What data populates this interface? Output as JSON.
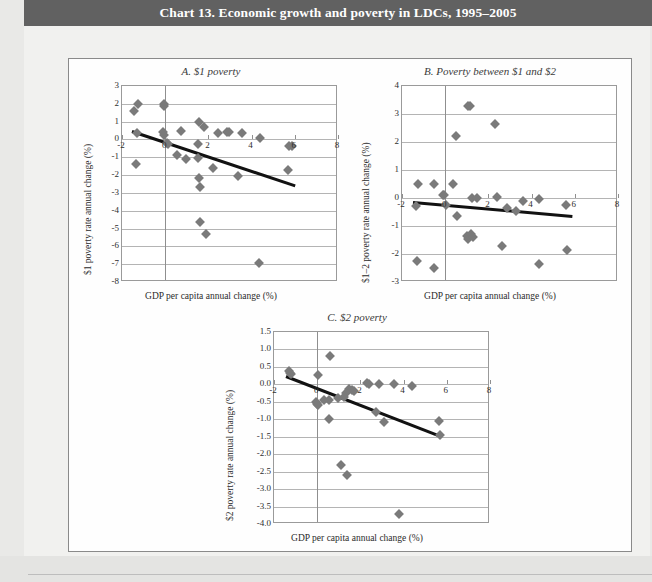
{
  "header": {
    "title": "Chart 13. Economic growth and poverty in LDCs, 1995–2005"
  },
  "colors": {
    "title_bar": "#616161",
    "marker": "#7a7a7a",
    "trendline": "#121212",
    "gridline": "#b4b4b4",
    "plot_background": "#ffffff",
    "page_background": "#e9e9e7"
  },
  "chart_data": [
    {
      "id": "panel-a",
      "type": "scatter",
      "title": "A.  $1 poverty",
      "xlabel": "GDP per capita annual change (%)",
      "ylabel": "$1 poverty rate annual change (%)",
      "xlim": [
        -2,
        8
      ],
      "ylim": [
        -8,
        3
      ],
      "xticks": [
        -2,
        0,
        2,
        4,
        6,
        8
      ],
      "yticks": [
        3,
        2,
        1,
        0,
        -1,
        -2,
        -3,
        -4,
        -5,
        -6,
        -7,
        -8
      ],
      "ytick_labels": [
        "3",
        "2",
        "1",
        "0",
        "-1",
        "-2",
        "-3",
        "-4",
        "-5",
        "-6",
        "-7",
        "-8"
      ],
      "xtick_labels": [
        "-2",
        "0",
        "2",
        "4",
        "6",
        "8"
      ],
      "grid": true,
      "legend": "none",
      "points": [
        {
          "x": -1.25,
          "y": 2.0
        },
        {
          "x": -1.45,
          "y": 1.6
        },
        {
          "x": -0.05,
          "y": 2.0
        },
        {
          "x": -0.05,
          "y": 1.85
        },
        {
          "x": -1.3,
          "y": 0.35
        },
        {
          "x": -0.1,
          "y": 0.4
        },
        {
          "x": -0.05,
          "y": 0.25
        },
        {
          "x": 0.75,
          "y": 0.45
        },
        {
          "x": 1.55,
          "y": 1.0
        },
        {
          "x": 1.8,
          "y": 0.7
        },
        {
          "x": 2.45,
          "y": 0.35
        },
        {
          "x": 2.85,
          "y": 0.4
        },
        {
          "x": 2.95,
          "y": 0.4
        },
        {
          "x": 3.55,
          "y": 0.35
        },
        {
          "x": 4.4,
          "y": 0.1
        },
        {
          "x": 5.75,
          "y": -0.35
        },
        {
          "x": 5.85,
          "y": -0.35
        },
        {
          "x": 0.1,
          "y": -0.2
        },
        {
          "x": 0.15,
          "y": -0.25
        },
        {
          "x": 1.5,
          "y": -0.25
        },
        {
          "x": 0.55,
          "y": -0.9
        },
        {
          "x": 0.95,
          "y": -1.1
        },
        {
          "x": 1.5,
          "y": -1.05
        },
        {
          "x": -1.35,
          "y": -1.4
        },
        {
          "x": 2.2,
          "y": -1.6
        },
        {
          "x": 5.7,
          "y": -1.7
        },
        {
          "x": 1.55,
          "y": -2.15
        },
        {
          "x": 3.35,
          "y": -2.05
        },
        {
          "x": 1.6,
          "y": -2.65
        },
        {
          "x": 1.6,
          "y": -4.65
        },
        {
          "x": 1.9,
          "y": -5.3
        },
        {
          "x": 4.35,
          "y": -6.95
        }
      ],
      "trendline": {
        "x1": -1.55,
        "y1": 0.55,
        "x2": 6.0,
        "y2": -2.5
      }
    },
    {
      "id": "panel-b",
      "type": "scatter",
      "title": "B.  Poverty between $1 and $2",
      "xlabel": "GDP per capita annual change (%)",
      "ylabel": "$1–2 poverty rate annual change (%)",
      "xlim": [
        -2,
        8
      ],
      "ylim": [
        -3,
        4
      ],
      "xticks": [
        -2,
        0,
        2,
        4,
        6,
        8
      ],
      "yticks": [
        4,
        3,
        2,
        1,
        0,
        -1,
        -2,
        -3
      ],
      "ytick_labels": [
        "4",
        "3",
        "2",
        "1",
        "0",
        "-1",
        "-2",
        "-3"
      ],
      "xtick_labels": [
        "-2",
        "0",
        "2",
        "4",
        "6",
        "8"
      ],
      "grid": true,
      "legend": "none",
      "points": [
        {
          "x": 1.05,
          "y": 3.3
        },
        {
          "x": 1.15,
          "y": 3.3
        },
        {
          "x": 2.3,
          "y": 2.65
        },
        {
          "x": 0.5,
          "y": 2.2
        },
        {
          "x": -1.25,
          "y": 0.5
        },
        {
          "x": -0.5,
          "y": 0.5
        },
        {
          "x": 0.35,
          "y": 0.5
        },
        {
          "x": -0.1,
          "y": 0.1
        },
        {
          "x": -0.05,
          "y": 0.1
        },
        {
          "x": 1.25,
          "y": 0.0
        },
        {
          "x": 1.45,
          "y": 0.0
        },
        {
          "x": 2.4,
          "y": 0.05
        },
        {
          "x": 3.6,
          "y": -0.1
        },
        {
          "x": 4.35,
          "y": -0.05
        },
        {
          "x": 0.05,
          "y": -0.25
        },
        {
          "x": 2.85,
          "y": -0.35
        },
        {
          "x": 3.3,
          "y": -0.45
        },
        {
          "x": 5.6,
          "y": -0.25
        },
        {
          "x": -1.35,
          "y": -0.3
        },
        {
          "x": 0.55,
          "y": -0.65
        },
        {
          "x": 1.0,
          "y": -1.35
        },
        {
          "x": 1.05,
          "y": -1.45
        },
        {
          "x": 1.2,
          "y": -1.3
        },
        {
          "x": 1.3,
          "y": -1.4
        },
        {
          "x": 2.65,
          "y": -1.7
        },
        {
          "x": 5.65,
          "y": -1.85
        },
        {
          "x": -1.3,
          "y": -2.25
        },
        {
          "x": 4.35,
          "y": -2.35
        },
        {
          "x": -0.5,
          "y": -2.5
        }
      ],
      "trendline": {
        "x1": -1.5,
        "y1": -0.1,
        "x2": 5.9,
        "y2": -0.6
      }
    },
    {
      "id": "panel-c",
      "type": "scatter",
      "title": "C.  $2 poverty",
      "xlabel": "GDP per capita annual change (%)",
      "ylabel": "$2 poverty rate annual change (%)",
      "xlim": [
        -2,
        8
      ],
      "ylim": [
        -4.0,
        1.5
      ],
      "xticks": [
        -2,
        0,
        2,
        4,
        6,
        8
      ],
      "yticks": [
        1.5,
        1.0,
        0.5,
        0.0,
        -0.5,
        -1.0,
        -1.5,
        -2.0,
        -2.5,
        -3.0,
        -3.5,
        -4.0
      ],
      "ytick_labels": [
        "1.5",
        "1.0",
        "0.5",
        "0.0",
        "-0.5",
        "-1.0",
        "-1.5",
        "-2.0",
        "-2.5",
        "-3.0",
        "-3.5",
        "-4.0"
      ],
      "xtick_labels": [
        "-2",
        "0",
        "2",
        "4",
        "6",
        "8"
      ],
      "grid": true,
      "legend": "none",
      "points": [
        {
          "x": 0.6,
          "y": 0.82
        },
        {
          "x": -1.3,
          "y": 0.38
        },
        {
          "x": -1.25,
          "y": 0.33
        },
        {
          "x": -1.2,
          "y": 0.3
        },
        {
          "x": 0.05,
          "y": 0.28
        },
        {
          "x": 2.3,
          "y": 0.05
        },
        {
          "x": 2.4,
          "y": 0.02
        },
        {
          "x": 2.85,
          "y": 0.02
        },
        {
          "x": 3.55,
          "y": 0.02
        },
        {
          "x": 4.4,
          "y": -0.05
        },
        {
          "x": 1.45,
          "y": -0.12
        },
        {
          "x": 1.6,
          "y": -0.15
        },
        {
          "x": 1.7,
          "y": -0.18
        },
        {
          "x": 1.35,
          "y": -0.25
        },
        {
          "x": 1.25,
          "y": -0.35
        },
        {
          "x": 0.95,
          "y": -0.38
        },
        {
          "x": 0.55,
          "y": -0.45
        },
        {
          "x": 0.3,
          "y": -0.45
        },
        {
          "x": -0.05,
          "y": -0.5
        },
        {
          "x": 0.0,
          "y": -0.55
        },
        {
          "x": 0.05,
          "y": -0.58
        },
        {
          "x": 2.7,
          "y": -0.78
        },
        {
          "x": 0.55,
          "y": -1.0
        },
        {
          "x": 3.1,
          "y": -1.08
        },
        {
          "x": 5.65,
          "y": -1.05
        },
        {
          "x": 5.7,
          "y": -1.45
        },
        {
          "x": 1.1,
          "y": -2.3
        },
        {
          "x": 1.4,
          "y": -2.6
        },
        {
          "x": 3.8,
          "y": -3.72
        }
      ],
      "trendline": {
        "x1": -1.45,
        "y1": 0.28,
        "x2": 5.75,
        "y2": -1.45
      }
    }
  ]
}
